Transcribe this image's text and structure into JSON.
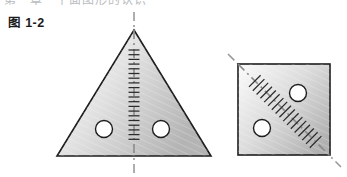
{
  "page": {
    "background_color": "#ffffff",
    "width": 347,
    "height": 177,
    "top_cut_text": "第一章　平面图形的认识"
  },
  "figure": {
    "caption": "图 1-2",
    "stroke_color": "#1d1d1d",
    "axis_color": "#8e8e8e",
    "fill_light": "#fdfdfd",
    "fill_dark": "#b9b9b9",
    "hole_fill": "#ffffff"
  },
  "shapes": [
    {
      "id": "triangle",
      "name": "isosceles-triangle",
      "label": "等腰三角形",
      "apex": {
        "x": 134,
        "y": 30
      },
      "base_left": {
        "x": 57,
        "y": 156
      },
      "base_right": {
        "x": 211,
        "y": 156
      },
      "symmetry_axis": {
        "type": "vertical",
        "x1": 134,
        "y1": 12,
        "x2": 134,
        "y2": 174,
        "tick_count": 20,
        "tick_length": 11,
        "tick_top": 50,
        "tick_bottom": 140
      },
      "holes": [
        {
          "cx": 104,
          "cy": 129,
          "r": 8.5
        },
        {
          "cx": 161,
          "cy": 129,
          "r": 8.5
        }
      ]
    },
    {
      "id": "square",
      "name": "square",
      "label": "正方形",
      "left": 238,
      "top": 64,
      "right": 330,
      "bottom": 155,
      "symmetry_axis": {
        "type": "diagonal",
        "x1": 228,
        "y1": 54,
        "x2": 341,
        "y2": 167,
        "tick_count": 17,
        "tick_length": 11,
        "tick_start_t": 0.16,
        "tick_end_t": 0.87
      },
      "holes": [
        {
          "cx": 298,
          "cy": 93,
          "r": 8.5
        },
        {
          "cx": 262,
          "cy": 128,
          "r": 8.5
        }
      ]
    }
  ]
}
